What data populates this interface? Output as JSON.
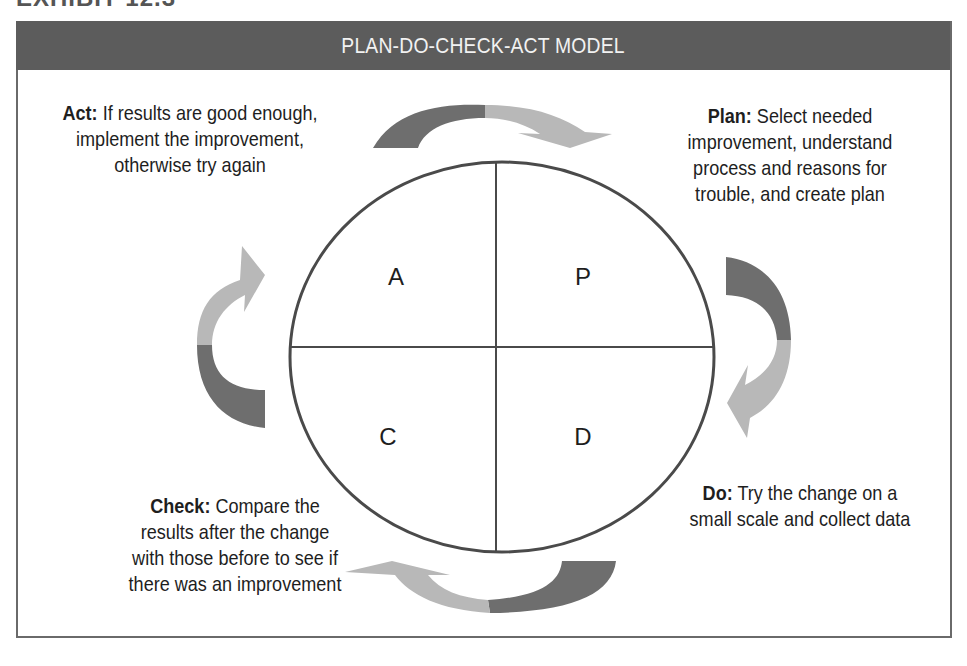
{
  "exhibit_label": "EXHIBIT 12.3",
  "header": {
    "title": "PLAN-DO-CHECK-ACT MODEL"
  },
  "quadrants": {
    "top_left": "A",
    "top_right": "P",
    "bottom_left": "C",
    "bottom_right": "D"
  },
  "steps": {
    "act": {
      "term": "Act:",
      "line1": " If results are good enough,",
      "line2": "implement the improvement,",
      "line3": "otherwise try again"
    },
    "plan": {
      "term": "Plan:",
      "line1": " Select needed",
      "line2": "improvement, understand",
      "line3": "process and reasons for",
      "line4": "trouble, and create plan"
    },
    "do": {
      "term": "Do:",
      "line1": " Try the change on a",
      "line2": "small scale and collect data"
    },
    "check": {
      "term": "Check:",
      "line1": " Compare the",
      "line2": "results after the change",
      "line3": "with those before to see if",
      "line4": "there was an improvement"
    }
  },
  "colors": {
    "header_bg": "#5c5c5c",
    "arrow_dark": "#6e6e6e",
    "arrow_light": "#b8b8b8",
    "circle_stroke": "#4a4a4a"
  }
}
